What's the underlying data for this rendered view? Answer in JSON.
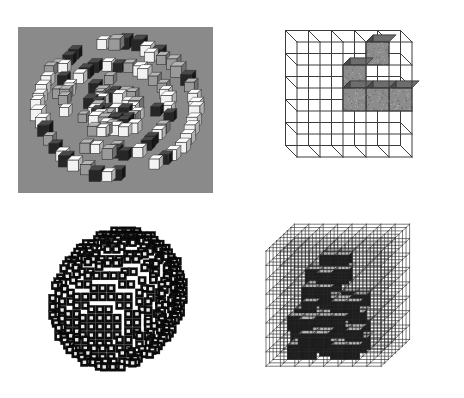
{
  "figure": {
    "title": "",
    "background_color": "#ffffff",
    "width": 464,
    "height": 398,
    "panel_count": 4
  },
  "panels": [
    {
      "id": "panel-a",
      "position": "top-left",
      "name": "photographed-cube-assembly",
      "label": "",
      "background_color": "#8a8a8a",
      "plate": {
        "x": 18,
        "y": 27,
        "width": 195,
        "height": 166
      },
      "cube_face_light": "#f2f2f2",
      "cube_face_mid": "#9a9a9a",
      "cube_face_dark": "#262626",
      "description": "Photograph of many small physical cubes arranged in a roughly circular/spherical cluster on a gray backdrop"
    },
    {
      "id": "panel-b",
      "position": "top-right",
      "name": "coarse-wireframe-voxel-grid",
      "label": "",
      "background_color": "#ffffff",
      "grid_cols": 5,
      "grid_rows": 5,
      "grid_depth": 1,
      "line_color": "#3c3c3c",
      "filled_voxel_color": "#8c8c8c",
      "filled_voxel_top_color": "#6d6d6d",
      "filled_voxel_side_color": "#4a4a4a",
      "filled_cells": [
        {
          "col": 3,
          "row": 0
        },
        {
          "col": 2,
          "row": 1
        },
        {
          "col": 2,
          "row": 2
        },
        {
          "col": 3,
          "row": 2
        },
        {
          "col": 4,
          "row": 2
        }
      ],
      "description": "5 by 5 wireframe cube grid with five shaded voxels forming an irregular shape"
    },
    {
      "id": "panel-c",
      "position": "bottom-left",
      "name": "dense-voxel-sphere",
      "label": "",
      "background_color": "#ffffff",
      "cube_outline_color": "#0d0d0d",
      "cube_face_color": "#e8e8e8",
      "radius_voxels": 7,
      "cube_pitch": 8.6,
      "description": "Dense spherical cluster built from hundreds of small dark cubes with light front faces"
    },
    {
      "id": "panel-d",
      "position": "bottom-right",
      "name": "fine-wireframe-voxel-lattice",
      "label": "",
      "background_color": "#ffffff",
      "grid_cols": 8,
      "grid_rows": 8,
      "grid_depth": 8,
      "line_color": "#2b2b2b",
      "filled_voxel_color": "#1e1e1e",
      "filled_voxel_top_color": "#b4b4b4",
      "filled_voxel_side_color": "#707070",
      "description": "8 by 8 by 8 wireframe lattice cube with a cluster of solid dark voxels occupying the interior"
    }
  ],
  "chart_data": {
    "type": "table",
    "categories": [
      "panel-a",
      "panel-b",
      "panel-c",
      "panel-d"
    ],
    "values": [
      0,
      5,
      0,
      0
    ],
    "xlabel": "",
    "ylabel": ""
  }
}
